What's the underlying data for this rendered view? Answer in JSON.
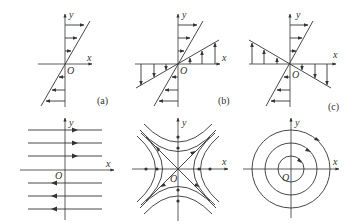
{
  "panels": [
    {
      "id": "a",
      "caption": "(a)",
      "x_label": "x",
      "y_label": "y",
      "origin_label": "O",
      "type": "shear-flow-single-line"
    },
    {
      "id": "b",
      "caption": "(b)",
      "x_label": "x",
      "y_label": "y",
      "origin_label": "O",
      "type": "shear-flow-two-lines-positive"
    },
    {
      "id": "c",
      "caption": "(c)",
      "x_label": "x",
      "y_label": "y",
      "origin_label": "O",
      "type": "shear-flow-two-lines-negative"
    },
    {
      "id": "d",
      "caption": "",
      "x_label": "x",
      "y_label": "y",
      "origin_label": "O",
      "type": "parallel-streamlines"
    },
    {
      "id": "e",
      "caption": "",
      "x_label": "x",
      "y_label": "y",
      "origin_label": "O",
      "type": "saddle-hyperbolic-streamlines"
    },
    {
      "id": "f",
      "caption": "",
      "x_label": "x",
      "y_label": "y",
      "origin_label": "O",
      "type": "concentric-circular-streamlines"
    }
  ]
}
